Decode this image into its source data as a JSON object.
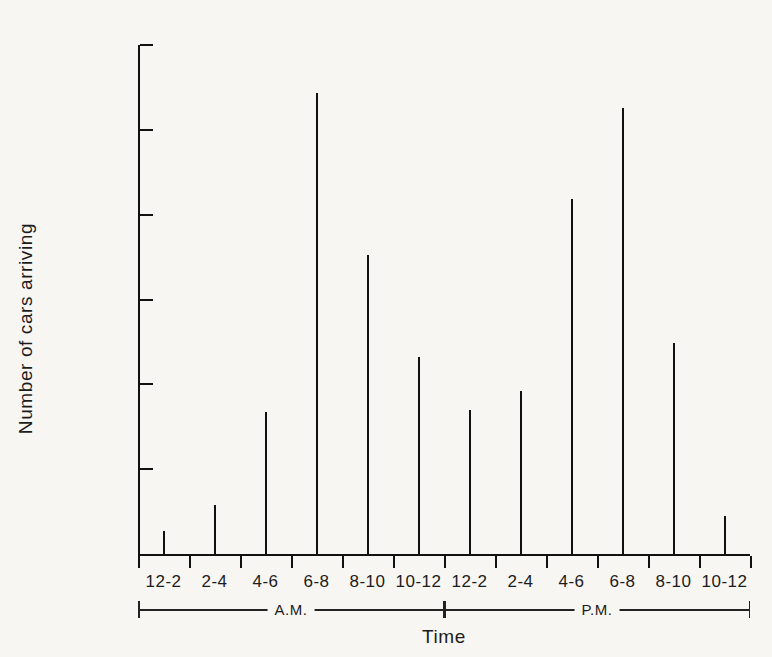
{
  "chart_data": {
    "type": "bar",
    "title": "",
    "xlabel": "Time",
    "ylabel": "Number of cars arriving",
    "categories": [
      "12-2",
      "2-4",
      "4-6",
      "6-8",
      "8-10",
      "10-12",
      "12-2",
      "2-4",
      "4-6",
      "6-8",
      "8-10",
      "10-12"
    ],
    "values": [
      270,
      580,
      1670,
      5430,
      3520,
      2320,
      1700,
      1920,
      4190,
      5260,
      2490,
      450
    ],
    "ylim": [
      0,
      6000
    ],
    "ytick_labels": [
      "6000",
      "5000",
      "4000",
      "3000",
      "2000",
      "1000"
    ],
    "ytick_values": [
      6000,
      5000,
      4000,
      3000,
      2000,
      1000
    ],
    "grid": false,
    "legend": "none",
    "groups": [
      {
        "label": "A.M.",
        "categories": [
          "12-2",
          "2-4",
          "4-6",
          "6-8",
          "8-10",
          "10-12"
        ]
      },
      {
        "label": "P.M.",
        "categories": [
          "12-2",
          "2-4",
          "4-6",
          "6-8",
          "8-10",
          "10-12"
        ]
      }
    ],
    "series": [
      {
        "name": "Number of cars arriving",
        "points": [
          {
            "period": "A.M.",
            "interval": "12-2",
            "value": 270
          },
          {
            "period": "A.M.",
            "interval": "2-4",
            "value": 580
          },
          {
            "period": "A.M.",
            "interval": "4-6",
            "value": 1670
          },
          {
            "period": "A.M.",
            "interval": "6-8",
            "value": 5430
          },
          {
            "period": "A.M.",
            "interval": "8-10",
            "value": 3520
          },
          {
            "period": "A.M.",
            "interval": "10-12",
            "value": 2320
          },
          {
            "period": "P.M.",
            "interval": "12-2",
            "value": 1700
          },
          {
            "period": "P.M.",
            "interval": "2-4",
            "value": 1920
          },
          {
            "period": "P.M.",
            "interval": "4-6",
            "value": 4190
          },
          {
            "period": "P.M.",
            "interval": "6-8",
            "value": 5260
          },
          {
            "period": "P.M.",
            "interval": "8-10",
            "value": 2490
          },
          {
            "period": "P.M.",
            "interval": "10-12",
            "value": 450
          }
        ]
      }
    ]
  },
  "colors": {
    "background": "#f8f6f3",
    "ink": "#111111",
    "text": "#1c1c1c"
  }
}
